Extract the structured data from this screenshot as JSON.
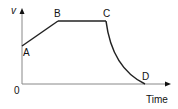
{
  "diagram": {
    "type": "velocity-time graph",
    "y_axis_label": "v",
    "x_axis_label": "Time",
    "origin_label": "0",
    "points": [
      {
        "label": "A",
        "x": 22,
        "y": 46
      },
      {
        "label": "B",
        "x": 58,
        "y": 21
      },
      {
        "label": "C",
        "x": 106,
        "y": 21
      },
      {
        "label": "D",
        "x": 145,
        "y": 84
      }
    ],
    "segments": [
      {
        "from": "A",
        "to": "B",
        "shape": "straight rising"
      },
      {
        "from": "B",
        "to": "C",
        "shape": "horizontal"
      },
      {
        "from": "C",
        "to": "D",
        "shape": "concave curve falling"
      }
    ]
  }
}
